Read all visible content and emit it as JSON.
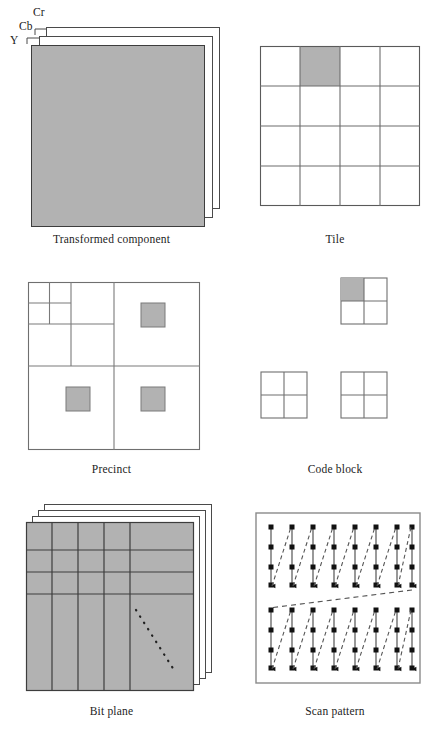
{
  "figure": {
    "background_color": "#ffffff",
    "gray_fill": "#b2b2b2",
    "line_color": "#3d3d3d",
    "light_line_color": "#8a8a8a",
    "width": 447,
    "height": 741
  },
  "panels": [
    {
      "id": "transformed-component",
      "caption": "Transformed component",
      "component_labels": [
        "Y",
        "Cb",
        "Cr"
      ],
      "layers": 3,
      "shaded": true
    },
    {
      "id": "tile",
      "caption": "Tile",
      "grid_cols": 4,
      "grid_rows": 4,
      "highlighted_cell": {
        "row": 1,
        "col": 2
      }
    },
    {
      "id": "precinct",
      "caption": "Precinct",
      "decomposition_levels": 3,
      "shaded_squares": 3
    },
    {
      "id": "code-block",
      "caption": "Code block",
      "blocks": 3,
      "grid_cols": 2,
      "grid_rows": 2,
      "highlighted_cell": {
        "block": 1,
        "row": 1,
        "col": 1
      }
    },
    {
      "id": "bit-plane",
      "caption": "Bit plane",
      "layers": 4,
      "vertical_divisions": 5,
      "horizontal_divisions": 4,
      "diagonal_marker": "dotted"
    },
    {
      "id": "scan-pattern",
      "caption": "Scan pattern",
      "stripes": 2,
      "columns_per_stripe": 8,
      "samples_per_column": 4,
      "scan_direction": "vertical down, left to right",
      "return_line_style": "dashed"
    }
  ],
  "labels": {
    "y": "Y",
    "cb": "Cb",
    "cr": "Cr",
    "transformed_component": "Transformed component",
    "tile": "Tile",
    "precinct": "Precinct",
    "code_block": "Code block",
    "bit_plane": "Bit plane",
    "scan_pattern": "Scan pattern"
  }
}
